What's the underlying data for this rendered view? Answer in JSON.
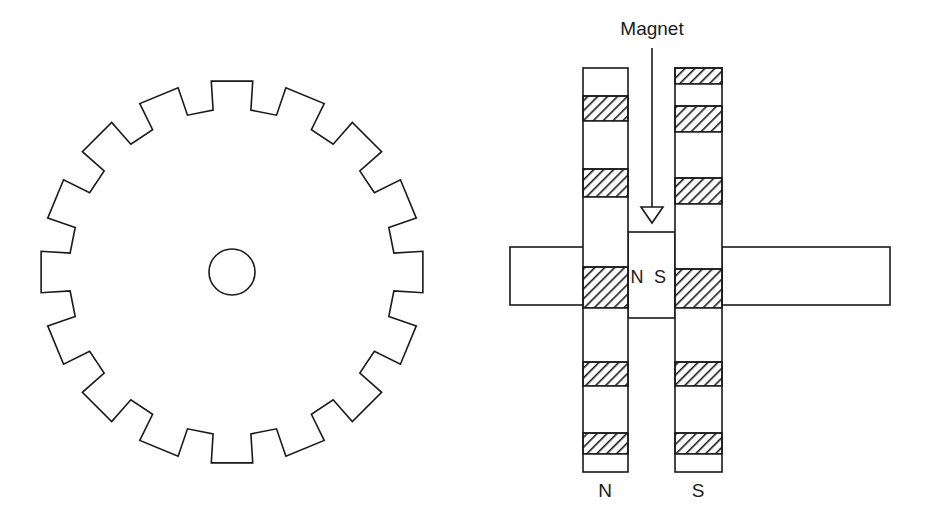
{
  "figure": {
    "background_color": "#ffffff",
    "line_color": "#1a1a1a",
    "canvas": {
      "width": 936,
      "height": 522
    }
  },
  "labels": {
    "magnet": "Magnet",
    "north_mid": "N",
    "south_mid": "S",
    "north_bottom": "N",
    "south_bottom": "S"
  },
  "gear": {
    "name": "toothed-gear-wheel",
    "center_x": 232,
    "center_y": 272,
    "tooth_count": 16,
    "outer_radius": 192,
    "root_radius": 163,
    "tooth_top_half_angle_deg": 6.2,
    "tooth_root_half_angle_deg": 4.6,
    "hub_radius": 23,
    "fill": "#ffffff",
    "stroke": "#1a1a1a"
  },
  "sensor": {
    "left_pole_piece": {
      "name": "left-pole-piece",
      "x": 583,
      "y": 68,
      "width": 45,
      "height": 404,
      "pole_label": "N",
      "bands": [
        {
          "y": 68,
          "height": 28,
          "type": "plain"
        },
        {
          "y": 96,
          "height": 25,
          "type": "hatched"
        },
        {
          "y": 121,
          "height": 48,
          "type": "plain"
        },
        {
          "y": 169,
          "height": 28,
          "type": "hatched"
        },
        {
          "y": 197,
          "height": 70,
          "type": "plain"
        },
        {
          "y": 267,
          "height": 41,
          "type": "hatched"
        },
        {
          "y": 308,
          "height": 54,
          "type": "plain"
        },
        {
          "y": 362,
          "height": 24,
          "type": "hatched"
        },
        {
          "y": 386,
          "height": 47,
          "type": "plain"
        },
        {
          "y": 433,
          "height": 21,
          "type": "hatched"
        },
        {
          "y": 454,
          "height": 18,
          "type": "plain"
        }
      ]
    },
    "right_pole_piece": {
      "name": "right-pole-piece",
      "x": 675,
      "y": 68,
      "width": 47,
      "height": 404,
      "pole_label": "S",
      "bands": [
        {
          "y": 68,
          "height": 16,
          "type": "hatched"
        },
        {
          "y": 84,
          "height": 22,
          "type": "plain"
        },
        {
          "y": 106,
          "height": 26,
          "type": "hatched"
        },
        {
          "y": 132,
          "height": 46,
          "type": "plain"
        },
        {
          "y": 178,
          "height": 26,
          "type": "hatched"
        },
        {
          "y": 204,
          "height": 65,
          "type": "plain"
        },
        {
          "y": 269,
          "height": 39,
          "type": "hatched"
        },
        {
          "y": 308,
          "height": 54,
          "type": "plain"
        },
        {
          "y": 362,
          "height": 24,
          "type": "hatched"
        },
        {
          "y": 386,
          "height": 47,
          "type": "plain"
        },
        {
          "y": 433,
          "height": 21,
          "type": "hatched"
        },
        {
          "y": 454,
          "height": 18,
          "type": "plain"
        }
      ]
    },
    "magnet_body": {
      "name": "magnet-body",
      "x": 628,
      "y": 232,
      "width": 47,
      "height": 86
    },
    "left_arm": {
      "name": "left-coil-arm",
      "x": 510,
      "y": 247,
      "width": 74,
      "height": 58
    },
    "right_arm": {
      "name": "right-coil-arm",
      "x": 722,
      "y": 247,
      "width": 168,
      "height": 58
    },
    "pointer": {
      "name": "magnet-pointer-arrow",
      "line_x": 652,
      "line_top": 48,
      "line_bottom": 207,
      "arrow_half_width": 11,
      "arrow_height": 16
    },
    "label_positions": {
      "magnet_x": 652,
      "magnet_y": 35,
      "ns_n_x": 637,
      "ns_s_x": 660,
      "ns_y": 283,
      "bottom_n_x": 605,
      "bottom_s_x": 698,
      "bottom_y": 497
    }
  }
}
